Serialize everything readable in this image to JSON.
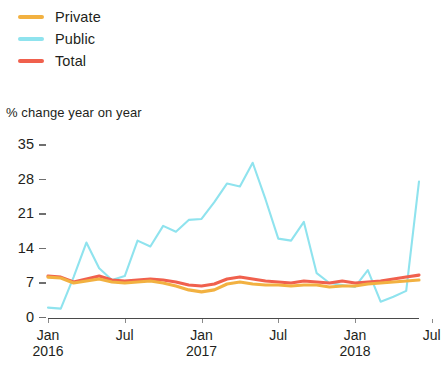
{
  "legend": {
    "items": [
      {
        "label": "Private",
        "color": "#F2B141",
        "name": "legend-item-private"
      },
      {
        "label": "Public",
        "color": "#8FE3EE",
        "name": "legend-item-public"
      },
      {
        "label": "Total",
        "color": "#F0604D",
        "name": "legend-item-total"
      }
    ]
  },
  "axis_title": "% change year on year",
  "chart_data": {
    "type": "line",
    "title": "",
    "subtitle": "",
    "xlabel": "",
    "ylabel": "% change year on year",
    "ylim": [
      0,
      35
    ],
    "yticks": [
      0,
      7,
      14,
      21,
      28,
      35
    ],
    "grid": false,
    "legend_position": "top-left",
    "x_tick_labels": [
      {
        "month": "Jan",
        "year": "2016"
      },
      {
        "month": "Jul",
        "year": ""
      },
      {
        "month": "Jan",
        "year": "2017"
      },
      {
        "month": "Jul",
        "year": ""
      },
      {
        "month": "Jan",
        "year": "2018"
      },
      {
        "month": "Jul",
        "year": ""
      }
    ],
    "x_tick_index": [
      0,
      6,
      12,
      18,
      24,
      30
    ],
    "x": [
      "2016-01",
      "2016-02",
      "2016-03",
      "2016-04",
      "2016-05",
      "2016-06",
      "2016-07",
      "2016-08",
      "2016-09",
      "2016-10",
      "2016-11",
      "2016-12",
      "2017-01",
      "2017-02",
      "2017-03",
      "2017-04",
      "2017-05",
      "2017-06",
      "2017-07",
      "2017-08",
      "2017-09",
      "2017-10",
      "2017-11",
      "2017-12",
      "2018-01",
      "2018-02",
      "2018-03",
      "2018-04",
      "2018-05",
      "2018-06"
    ],
    "series": [
      {
        "name": "Public",
        "color": "#8FE3EE",
        "values": [
          2.0,
          1.8,
          8.2,
          15.2,
          10.0,
          7.6,
          8.4,
          15.6,
          14.4,
          18.6,
          17.4,
          19.8,
          20.0,
          23.4,
          27.2,
          26.6,
          31.4,
          24.0,
          16.0,
          15.6,
          19.4,
          9.0,
          7.0,
          6.6,
          6.2,
          9.6,
          3.2,
          4.2,
          5.4,
          27.6
        ]
      },
      {
        "name": "Total",
        "color": "#F0604D",
        "values": [
          8.4,
          8.2,
          7.2,
          7.8,
          8.4,
          7.6,
          7.4,
          7.6,
          7.8,
          7.6,
          7.2,
          6.6,
          6.4,
          6.8,
          7.8,
          8.2,
          7.8,
          7.4,
          7.2,
          7.0,
          7.4,
          7.2,
          7.0,
          7.4,
          7.0,
          7.2,
          7.4,
          7.8,
          8.2,
          8.6
        ]
      },
      {
        "name": "Private",
        "color": "#F2B141",
        "values": [
          8.2,
          8.0,
          7.0,
          7.4,
          7.8,
          7.2,
          7.0,
          7.2,
          7.4,
          7.0,
          6.4,
          5.6,
          5.2,
          5.6,
          6.8,
          7.2,
          6.8,
          6.6,
          6.6,
          6.4,
          6.6,
          6.6,
          6.2,
          6.4,
          6.4,
          6.8,
          7.0,
          7.2,
          7.4,
          7.6
        ]
      }
    ]
  }
}
